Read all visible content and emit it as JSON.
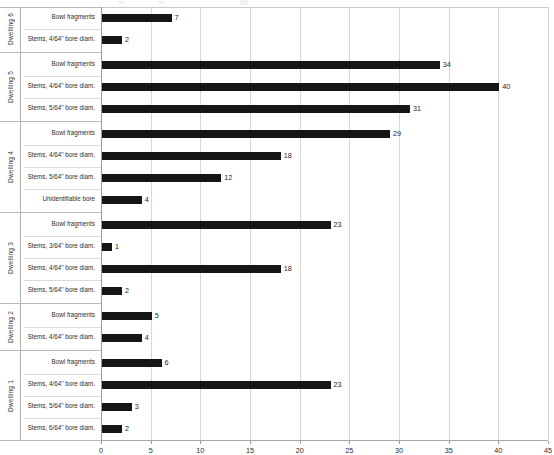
{
  "chart_data": {
    "type": "bar",
    "orientation": "horizontal",
    "title": "",
    "xlabel": "",
    "ylabel": "",
    "xlim": [
      0,
      45
    ],
    "xticks": [
      0,
      5,
      10,
      15,
      20,
      25,
      30,
      35,
      40,
      45
    ],
    "grid": true,
    "legend": false,
    "bar_color": "#161616",
    "groups": [
      {
        "name": "Dwelling 6",
        "categories": [
          "Bowl fragments",
          "Stems, 4/64\" bore diam."
        ],
        "values": [
          7,
          2
        ]
      },
      {
        "name": "Dwelling 5",
        "categories": [
          "Bowl fragments",
          "Stems, 4/64\" bore diam.",
          "Stems, 5/64\" bore diam."
        ],
        "values": [
          34,
          40,
          31
        ]
      },
      {
        "name": "Dwelling 4",
        "categories": [
          "Bowl fragments",
          "Stems, 4/64\" bore diam.",
          "Stems, 5/64\" bore diam.",
          "Unidentifiable bore"
        ],
        "values": [
          29,
          18,
          12,
          4
        ]
      },
      {
        "name": "Dwelling 3",
        "categories": [
          "Bowl fragments",
          "Stems, 3/64\" bore diam.",
          "Stems, 4/64\" bore diam.",
          "Stems, 5/64\" bore diam."
        ],
        "values": [
          23,
          1,
          18,
          2
        ]
      },
      {
        "name": "Dwelling 2",
        "categories": [
          "Bowl fragments",
          "Stems, 4/64\" bore diam."
        ],
        "values": [
          5,
          4
        ]
      },
      {
        "name": "Dwelling 1",
        "categories": [
          "Bowl fragments",
          "Stems, 4/64\" bore diam.",
          "Stems, 5/64\" bore diam.",
          "Stems, 6/64\" bore diam."
        ],
        "values": [
          6,
          23,
          3,
          2
        ]
      }
    ]
  }
}
